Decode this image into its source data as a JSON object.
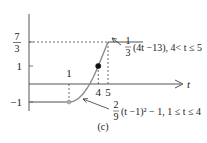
{
  "chart_data": {
    "type": "line",
    "title": "",
    "caption": "(c)",
    "xlabel": "t",
    "ylabel": "",
    "xlim": [
      -1.5,
      8.5
    ],
    "ylim": [
      -1.4,
      2.6
    ],
    "grid": false,
    "x_ticks": [
      {
        "value": 1,
        "label": "1",
        "position": "above-axis"
      },
      {
        "value": 4,
        "label": "4",
        "position": "below-axis"
      },
      {
        "value": 5,
        "label": "5",
        "position": "below-axis"
      }
    ],
    "y_ticks": [
      {
        "value": 2.3333,
        "label_num": "7",
        "label_den": "3",
        "fraction": true
      },
      {
        "value": 1,
        "label": "1",
        "fraction": false
      },
      {
        "value": -1,
        "label": "−1",
        "fraction": false
      }
    ],
    "series": [
      {
        "name": "constant-left",
        "formula": "-1",
        "domain": [
          -1.5,
          1
        ],
        "points": [
          [
            -1.5,
            -1
          ],
          [
            1,
            -1
          ]
        ]
      },
      {
        "name": "parabola",
        "formula": "2/9 (t-1)^2 - 1",
        "domain": [
          1,
          4
        ]
      },
      {
        "name": "linear",
        "formula": "1/3 (4t - 13)",
        "domain": [
          4,
          5
        ],
        "points": [
          [
            4,
            1
          ],
          [
            5,
            2.3333
          ]
        ]
      },
      {
        "name": "constant-right",
        "formula": "7/3",
        "domain": [
          5,
          7
        ],
        "points": [
          [
            5,
            2.3333
          ],
          [
            7,
            2.3333
          ]
        ]
      }
    ],
    "markers": [
      {
        "x": 1,
        "y": -1,
        "style": "open-gray"
      },
      {
        "x": 4,
        "y": 1,
        "style": "filled-black"
      }
    ],
    "guides": [
      {
        "from": [
          1,
          -1
        ],
        "to": [
          1,
          0
        ],
        "style": "dashed"
      },
      {
        "from": [
          4,
          0
        ],
        "to": [
          4,
          1
        ],
        "style": "dashed"
      },
      {
        "from": [
          5,
          0
        ],
        "to": [
          5,
          2.3333
        ],
        "style": "dashed"
      },
      {
        "from": [
          0,
          2.3333
        ],
        "to": [
          5,
          2.3333
        ],
        "style": "dashed"
      }
    ],
    "annotations": [
      {
        "id": "linear",
        "frac_num": "1",
        "frac_den": "3",
        "text": "(4t −13), 4< t ≤ 5",
        "points_to": [
          4.75,
          2.0
        ]
      },
      {
        "id": "parabola",
        "frac_num": "2",
        "frac_den": "9",
        "text": "(t −1)² − 1, 1 ≤ t ≤ 4",
        "points_to": [
          2.3,
          -0.9
        ]
      }
    ]
  }
}
